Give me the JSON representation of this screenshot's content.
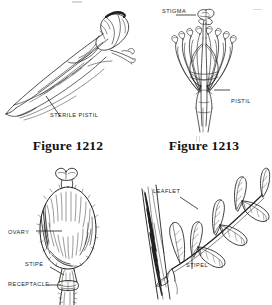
{
  "page": {
    "background_color": "#ffffff",
    "ink_color": "#1a1a1a",
    "figure_count": 4
  },
  "figures": [
    {
      "id": "figure-1212",
      "caption": "Figure 1212",
      "subject": "sterile-pistil-diagram",
      "labels": [
        {
          "id": "sterile-pistil",
          "text": "STERILE PISTIL"
        }
      ]
    },
    {
      "id": "figure-1213",
      "caption": "Figure 1213",
      "subject": "pistil-and-stamens-diagram",
      "labels": [
        {
          "id": "stigma",
          "text": "STIGMA"
        },
        {
          "id": "pistil",
          "text": "PISTIL"
        }
      ]
    },
    {
      "id": "figure-ovary",
      "caption": "",
      "subject": "ovary-stipe-receptacle-diagram",
      "labels": [
        {
          "id": "ovary",
          "text": "OVARY"
        },
        {
          "id": "stipe",
          "text": "STIPE"
        },
        {
          "id": "receptacle",
          "text": "RECEPTACLE"
        }
      ]
    },
    {
      "id": "figure-leaflet",
      "caption": "",
      "subject": "compound-leaf-leaflet-stipel-diagram",
      "labels": [
        {
          "id": "leaflet",
          "text": "LEAFLET"
        },
        {
          "id": "stipel",
          "text": "STIPEL"
        }
      ]
    }
  ]
}
